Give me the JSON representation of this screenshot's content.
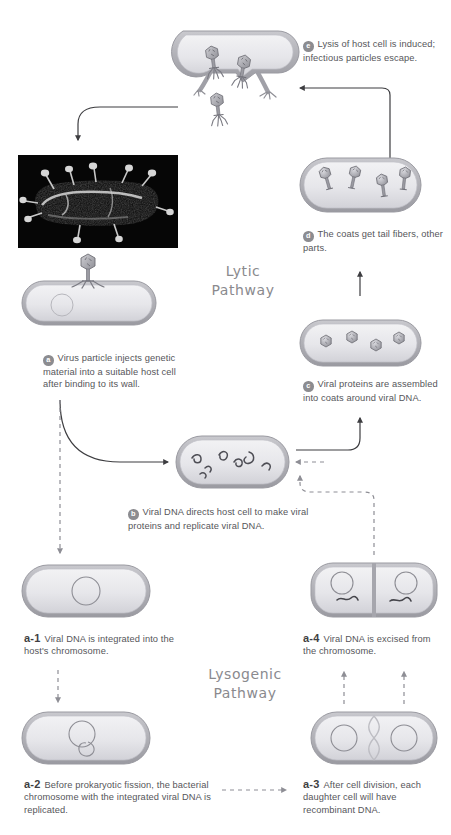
{
  "figure": {
    "title_lytic": "Lytic\nPathway",
    "title_lytic_line1": "Lytic",
    "title_lytic_line2": "Pathway",
    "title_lysogenic_line1": "Lysogenic",
    "title_lysogenic_line2": "Pathway"
  },
  "steps": {
    "a": {
      "badge": "a",
      "text": "Virus particle injects genetic material into a suitable host cell after binding to its wall."
    },
    "b": {
      "badge": "b",
      "text": "Viral DNA directs host cell to make viral proteins and replicate viral DNA."
    },
    "c": {
      "badge": "c",
      "text": "Viral proteins are assembled into coats around viral DNA."
    },
    "d": {
      "badge": "d",
      "text": "The coats get tail fibers, other parts."
    },
    "e": {
      "badge": "e",
      "text": "Lysis of host cell is induced; infectious particles escape."
    },
    "a1": {
      "number": "a-1",
      "text": "Viral DNA is integrated into the host's chromosome."
    },
    "a2": {
      "number": "a-2",
      "text": "Before prokaryotic fission, the bacterial chromosome with the integrated viral DNA is replicated."
    },
    "a3": {
      "number": "a-3",
      "text": "After cell division, each daughter cell will have recombinant DNA."
    },
    "a4": {
      "number": "a-4",
      "text": "Viral DNA is excised from the chromosome."
    }
  },
  "images": {
    "micrograph_caption": "",
    "micrograph_alt": "electron micrograph of bacterium with bacteriophages attached"
  },
  "colors": {
    "cell_wall": "#b3b3b8",
    "cell_interior": "#e9e9ec",
    "phage": "#9a9aa0",
    "text": "#56565a",
    "badge": "#8c8c90",
    "arrow": "#4a4a4d",
    "title": "#8a8a8e"
  }
}
